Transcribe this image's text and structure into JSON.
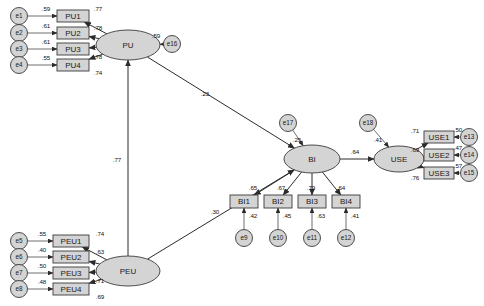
{
  "diagram": {
    "type": "sem-path-diagram",
    "latent_variables": [
      {
        "id": "PU",
        "label": "PU",
        "cx": 128,
        "cy": 45,
        "rx": 32,
        "ry": 15
      },
      {
        "id": "PEU",
        "label": "PEU",
        "cx": 128,
        "cy": 271,
        "rx": 32,
        "ry": 15
      },
      {
        "id": "BI",
        "label": "BI",
        "cx": 312,
        "cy": 159,
        "rx": 28,
        "ry": 14
      },
      {
        "id": "USE",
        "label": "USE",
        "cx": 399,
        "cy": 159,
        "rx": 25,
        "ry": 13
      }
    ],
    "observed_variables": [
      {
        "id": "PU1",
        "label": "PU1",
        "x": 57,
        "y": 10,
        "w": 32,
        "h": 12
      },
      {
        "id": "PU2",
        "label": "PU2",
        "x": 57,
        "y": 27,
        "w": 32,
        "h": 12
      },
      {
        "id": "PU3",
        "label": "PU3",
        "x": 57,
        "y": 43,
        "w": 32,
        "h": 12
      },
      {
        "id": "PU4",
        "label": "PU4",
        "x": 57,
        "y": 59,
        "w": 32,
        "h": 12
      },
      {
        "id": "PEU1",
        "label": "PEU1",
        "x": 53,
        "y": 235,
        "w": 36,
        "h": 12
      },
      {
        "id": "PEU2",
        "label": "PEU2",
        "x": 53,
        "y": 251,
        "w": 36,
        "h": 12
      },
      {
        "id": "PEU3",
        "label": "PEU3",
        "x": 53,
        "y": 267,
        "w": 36,
        "h": 12
      },
      {
        "id": "PEU4",
        "label": "PEU4",
        "x": 53,
        "y": 283,
        "w": 36,
        "h": 12
      },
      {
        "id": "BI1",
        "label": "BI1",
        "x": 230,
        "y": 195,
        "w": 28,
        "h": 13
      },
      {
        "id": "BI2",
        "label": "BI2",
        "x": 264,
        "y": 195,
        "w": 28,
        "h": 13
      },
      {
        "id": "BI3",
        "label": "BI3",
        "x": 298,
        "y": 195,
        "w": 28,
        "h": 13
      },
      {
        "id": "BI4",
        "label": "BI4",
        "x": 332,
        "y": 195,
        "w": 28,
        "h": 13
      },
      {
        "id": "USE1",
        "label": "USE1",
        "x": 424,
        "y": 131,
        "w": 30,
        "h": 12
      },
      {
        "id": "USE2",
        "label": "USE2",
        "x": 424,
        "y": 149,
        "w": 30,
        "h": 12
      },
      {
        "id": "USE3",
        "label": "USE3",
        "x": 424,
        "y": 167,
        "w": 30,
        "h": 12
      }
    ],
    "error_terms": [
      {
        "id": "e1",
        "label": "e1",
        "cx": 19,
        "cy": 16
      },
      {
        "id": "e2",
        "label": "e2",
        "cx": 19,
        "cy": 33
      },
      {
        "id": "e3",
        "label": "e3",
        "cx": 19,
        "cy": 49
      },
      {
        "id": "e4",
        "label": "e4",
        "cx": 19,
        "cy": 65
      },
      {
        "id": "e5",
        "label": "e5",
        "cx": 19,
        "cy": 241
      },
      {
        "id": "e6",
        "label": "e6",
        "cx": 19,
        "cy": 257
      },
      {
        "id": "e7",
        "label": "e7",
        "cx": 19,
        "cy": 273
      },
      {
        "id": "e8",
        "label": "e8",
        "cx": 19,
        "cy": 289
      },
      {
        "id": "e9",
        "label": "e9",
        "cx": 244,
        "cy": 238
      },
      {
        "id": "e10",
        "label": "e10",
        "cx": 278,
        "cy": 238
      },
      {
        "id": "e11",
        "label": "e11",
        "cx": 312,
        "cy": 238
      },
      {
        "id": "e12",
        "label": "e12",
        "cx": 346,
        "cy": 238
      },
      {
        "id": "e13",
        "label": "e13",
        "cx": 469,
        "cy": 137
      },
      {
        "id": "e14",
        "label": "e14",
        "cx": 469,
        "cy": 155
      },
      {
        "id": "e15",
        "label": "e15",
        "cx": 469,
        "cy": 173
      },
      {
        "id": "e16",
        "label": "e16",
        "cx": 172,
        "cy": 44
      },
      {
        "id": "e17",
        "label": "e17",
        "cx": 288,
        "cy": 123
      },
      {
        "id": "e18",
        "label": "e18",
        "cx": 368,
        "cy": 123
      }
    ],
    "error_paths": [
      {
        "from": "e1",
        "to": "PU1",
        "value": ".59",
        "lx": 46,
        "ly": 9
      },
      {
        "from": "e2",
        "to": "PU2",
        "value": ".61",
        "lx": 46,
        "ly": 26
      },
      {
        "from": "e3",
        "to": "PU3",
        "value": ".61",
        "lx": 46,
        "ly": 42
      },
      {
        "from": "e4",
        "to": "PU4",
        "value": ".55",
        "lx": 46,
        "ly": 58
      },
      {
        "from": "e5",
        "to": "PEU1",
        "value": ".55",
        "lx": 42,
        "ly": 234
      },
      {
        "from": "e6",
        "to": "PEU2",
        "value": ".40",
        "lx": 42,
        "ly": 250
      },
      {
        "from": "e7",
        "to": "PEU3",
        "value": ".50",
        "lx": 42,
        "ly": 266
      },
      {
        "from": "e8",
        "to": "PEU4",
        "value": ".48",
        "lx": 42,
        "ly": 282
      },
      {
        "from": "e9",
        "to": "BI1",
        "value": ".42",
        "lx": 253,
        "ly": 216
      },
      {
        "from": "e10",
        "to": "BI2",
        "value": ".45",
        "lx": 287,
        "ly": 216
      },
      {
        "from": "e11",
        "to": "BI3",
        "value": ".63",
        "lx": 321,
        "ly": 216
      },
      {
        "from": "e12",
        "to": "BI4",
        "value": ".41",
        "lx": 355,
        "ly": 216
      },
      {
        "from": "e13",
        "to": "USE1",
        "value": ".50",
        "lx": 458,
        "ly": 130
      },
      {
        "from": "e14",
        "to": "USE2",
        "value": ".47",
        "lx": 458,
        "ly": 148
      },
      {
        "from": "e15",
        "to": "USE3",
        "value": ".57",
        "lx": 458,
        "ly": 166
      },
      {
        "from": "e16",
        "to": "PU",
        "value": ".59",
        "lx": 156,
        "ly": 36
      },
      {
        "from": "e17",
        "to": "BI",
        "value": ".25",
        "lx": 297,
        "ly": 140
      },
      {
        "from": "e18",
        "to": "USE",
        "value": ".41",
        "lx": 378,
        "ly": 140
      }
    ],
    "factor_loadings": [
      {
        "from": "PU",
        "to": "PU1",
        "value": ".77",
        "lx": 98,
        "ly": 9
      },
      {
        "from": "PU",
        "to": "PU2",
        "value": ".78",
        "lx": 98,
        "ly": 28
      },
      {
        "from": "PU",
        "to": "PU3",
        "value": ".78",
        "lx": 98,
        "ly": 57
      },
      {
        "from": "PU",
        "to": "PU4",
        "value": ".74",
        "lx": 98,
        "ly": 73
      },
      {
        "from": "PEU",
        "to": "PEU1",
        "value": ".74",
        "lx": 100,
        "ly": 234
      },
      {
        "from": "PEU",
        "to": "PEU2",
        "value": ".63",
        "lx": 100,
        "ly": 252
      },
      {
        "from": "PEU",
        "to": "PEU3",
        "value": ".71",
        "lx": 100,
        "ly": 281
      },
      {
        "from": "PEU",
        "to": "PEU4",
        "value": ".69",
        "lx": 100,
        "ly": 297
      },
      {
        "from": "BI",
        "to": "BI1",
        "value": ".65",
        "lx": 253,
        "ly": 188
      },
      {
        "from": "BI",
        "to": "BI2",
        "value": ".67",
        "lx": 281,
        "ly": 188
      },
      {
        "from": "BI",
        "to": "BI3",
        "value": ".79",
        "lx": 311,
        "ly": 188
      },
      {
        "from": "BI",
        "to": "BI4",
        "value": ".64",
        "lx": 341,
        "ly": 188
      },
      {
        "from": "USE",
        "to": "USE1",
        "value": ".71",
        "lx": 415,
        "ly": 131
      },
      {
        "from": "USE",
        "to": "USE2",
        "value": ".69",
        "lx": 415,
        "ly": 150
      },
      {
        "from": "USE",
        "to": "USE3",
        "value": ".76",
        "lx": 415,
        "ly": 178
      }
    ],
    "structural_paths": [
      {
        "from": "PEU",
        "to": "PU",
        "value": ".77",
        "lx": 117,
        "ly": 160
      },
      {
        "from": "PU",
        "to": "BI",
        "value": ".23",
        "lx": 205,
        "ly": 94
      },
      {
        "from": "PEU",
        "to": "BI",
        "value": ".30",
        "lx": 215,
        "ly": 212
      },
      {
        "from": "BI",
        "to": "USE",
        "value": ".64",
        "lx": 355,
        "ly": 152
      }
    ]
  }
}
